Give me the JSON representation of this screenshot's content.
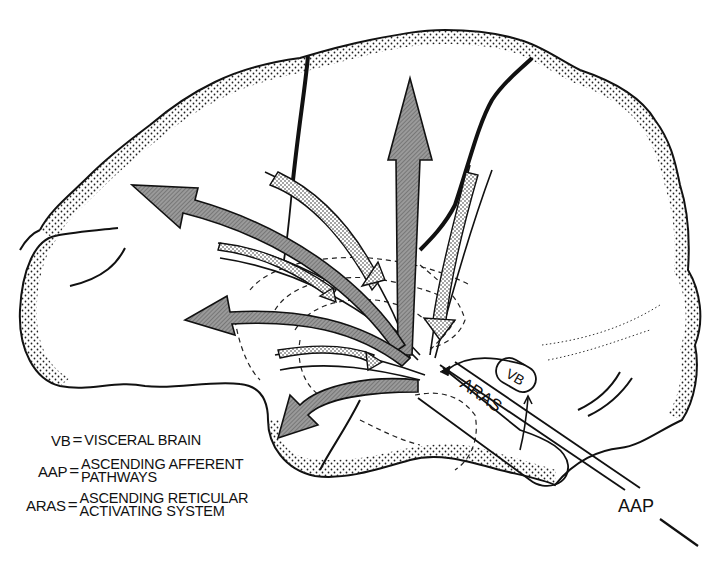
{
  "diagram": {
    "labels": {
      "vb": "VB",
      "aras": "ARAS",
      "aap": "AAP"
    },
    "legend": [
      {
        "abbr": "VB",
        "eq": "=",
        "lines": [
          "VISCERAL BRAIN"
        ]
      },
      {
        "abbr": "AAP",
        "eq": "=",
        "lines": [
          "ASCENDING AFFERENT",
          "PATHWAYS"
        ]
      },
      {
        "abbr": "ARAS",
        "eq": "=",
        "lines": [
          "ASCENDING RETICULAR",
          "ACTIVATING SYSTEM"
        ]
      }
    ],
    "colors": {
      "outline": "#111111",
      "arrow_fill": "#8a8a8a",
      "stipple": "#222222",
      "background": "#ffffff"
    },
    "arrows": {
      "efferent_hatched": [
        "upward-to-vertex",
        "anterior-to-frontal-pole",
        "anterior-mid-frontal",
        "inferior-to-temporal"
      ],
      "afferent_stippled": [
        "from-superior-frontal",
        "from-parietal",
        "from-mid-frontal",
        "from-lower-frontal"
      ]
    }
  }
}
